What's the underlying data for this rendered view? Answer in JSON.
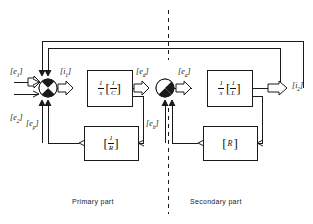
{
  "figure": {
    "type": "block-diagram",
    "background": "#ffffff",
    "line_color": "#1a1a1a"
  },
  "captions": {
    "primary": "Primary part",
    "secondary": "Secondary part"
  },
  "signals": {
    "input_top": "e",
    "input_top_sub": "1",
    "input_bottom": "e",
    "input_bottom_sub": "2",
    "after_sum1": "i",
    "after_sum1_sub": "1",
    "feedback1": "e",
    "feedback1_sub": "p",
    "into_sum2": "e",
    "into_sum2_sub": "d",
    "after_sum2": "e",
    "after_sum2_sub": "a",
    "feedback2": "e",
    "feedback2_sub": "b",
    "output": "i",
    "output_sub": "2"
  },
  "blocks": [
    {
      "id": "integrator-primary",
      "name": "primary-integrator-block",
      "integrator_num": "1",
      "integrator_den": "s",
      "gain_num": "1",
      "gain_den": "C",
      "bracketed": true
    },
    {
      "id": "integrator-secondary",
      "name": "secondary-integrator-block",
      "integrator_num": "1",
      "integrator_den": "s",
      "gain_num": "1",
      "gain_den": "L",
      "bracketed": true
    },
    {
      "id": "feedback-primary",
      "name": "primary-feedback-gain-block",
      "gain_num": "1",
      "gain_den": "R",
      "bracketed": true
    },
    {
      "id": "feedback-secondary",
      "name": "secondary-feedback-gain-block",
      "gain_plain": "R",
      "bracketed": true
    }
  ],
  "summing_junctions": [
    {
      "id": "sum-1",
      "name": "primary-summing-junction",
      "style": "quadrant-circle"
    },
    {
      "id": "sum-2",
      "name": "secondary-summing-junction",
      "style": "quadrant-circle"
    }
  ],
  "divider": {
    "name": "section-divider",
    "style": "dashed-vertical"
  }
}
